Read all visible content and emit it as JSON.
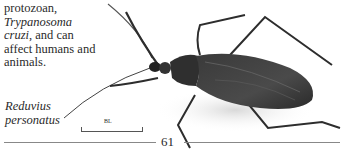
{
  "intro": {
    "line1": "protozoan,",
    "species_italic": "Trypanosoma",
    "species_italic2": "cruzi",
    "line3_rest": ", and can",
    "line4": "affect humans and",
    "line5": "animals."
  },
  "caption": {
    "line1": "Reduvius",
    "line2": "personatus"
  },
  "scale_bar": {
    "label": "BL"
  },
  "page_number": "61",
  "illustration": {
    "subject": "Reduvius personatus (masked hunter assassin bug)"
  }
}
